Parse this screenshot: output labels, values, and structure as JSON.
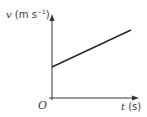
{
  "diagram": {
    "type": "velocity-time graph",
    "y_axis": {
      "symbol": "v",
      "unit_open": "(m s",
      "unit_exp": "−1",
      "unit_close": ")"
    },
    "x_axis": {
      "symbol": "t",
      "unit": "(s)"
    },
    "origin_label": "O",
    "line": {
      "description": "straight line with positive gradient and positive v-intercept"
    },
    "colors": {
      "axis": "#333333",
      "line": "#2a2a2a",
      "text": "#3a3a3a"
    }
  }
}
